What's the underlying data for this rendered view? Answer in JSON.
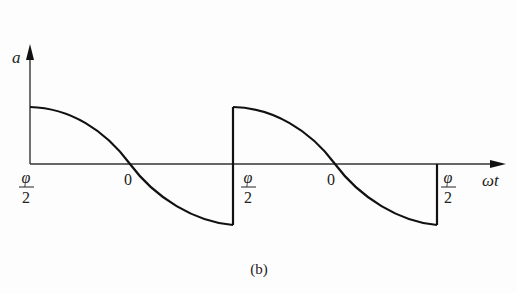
{
  "figure": {
    "caption": "(b)",
    "y_axis_label": "a",
    "x_axis_label": "ωt",
    "tick_labels": [
      {
        "id": "t0",
        "type": "fraction",
        "numerator": "φ",
        "denominator": "2",
        "x": 30
      },
      {
        "id": "t1",
        "type": "plain",
        "text": "0",
        "x": 129
      },
      {
        "id": "t2",
        "type": "fraction",
        "numerator": "φ",
        "denominator": "2",
        "x": 248
      },
      {
        "id": "t3",
        "type": "plain",
        "text": "0",
        "x": 332
      },
      {
        "id": "t4",
        "type": "fraction",
        "numerator": "φ",
        "denominator": "2",
        "x": 448
      }
    ],
    "waveform": {
      "description": "Periodic cosine-segment waveform with vertical jumps at ±φ/2",
      "segments": [
        {
          "from_x": 30,
          "to_x": 233,
          "zero_cross_x": 130,
          "start": "max",
          "end": "min"
        },
        {
          "from_x": 233,
          "to_x": 437,
          "zero_cross_x": 335,
          "start": "max",
          "end": "min"
        }
      ],
      "stroke_color": "#111111"
    },
    "axis_color": "#333333"
  }
}
